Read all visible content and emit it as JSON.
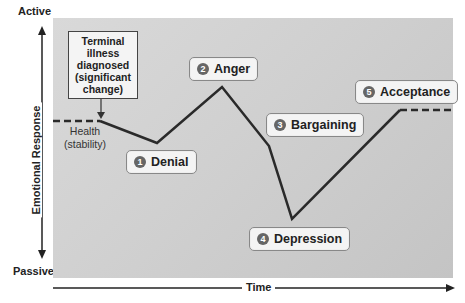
{
  "axes": {
    "y_top": "Active",
    "y_bottom": "Passive",
    "y_label": "Emotional Response",
    "x_label": "Time"
  },
  "callout": {
    "text": "Terminal illness diagnosed (significant change)"
  },
  "baseline_label": "Health (stability)",
  "stages": [
    {
      "number": "1",
      "label": "Denial"
    },
    {
      "number": "2",
      "label": "Anger"
    },
    {
      "number": "3",
      "label": "Bargaining"
    },
    {
      "number": "4",
      "label": "Depression"
    },
    {
      "number": "5",
      "label": "Acceptance"
    }
  ],
  "colors": {
    "panel": "#d0d0d0",
    "line": "#2a2a2a",
    "badge": "#666666"
  }
}
